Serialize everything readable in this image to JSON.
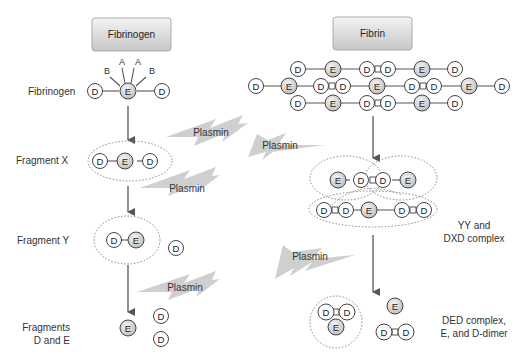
{
  "left_header": "Fibrinogen",
  "right_header": "Fibrin",
  "left_labels": {
    "fibrinogen": "Fibrinogen",
    "fragment_x": "Fragment X",
    "fragment_y": "Fragment Y",
    "fragments_de_1": "Fragments",
    "fragments_de_2": "D and E"
  },
  "right_labels": {
    "yy_1": "YY and",
    "yy_2": "DXD complex",
    "ded_1": "DED complex,",
    "ded_2": "E, and D-dimer"
  },
  "fibrinopeptides": [
    "B",
    "A",
    "A",
    "B"
  ],
  "enzyme_label": "Plasmin",
  "plasmin_bolts": [
    "Plasmin",
    "Plasmin",
    "Plasmin",
    "Plasmin",
    "Plasmin"
  ],
  "node_letters": {
    "D": "D",
    "E": "E"
  },
  "colors": {
    "box_fill_top": "#f2f2f2",
    "box_fill_bottom": "#c8c8c8",
    "bolt": "#cfcfcf",
    "line": "#555555",
    "e_node_fill": "#d8d8d8",
    "d_node_fill": "#ffffff",
    "dotted": "#888888"
  }
}
